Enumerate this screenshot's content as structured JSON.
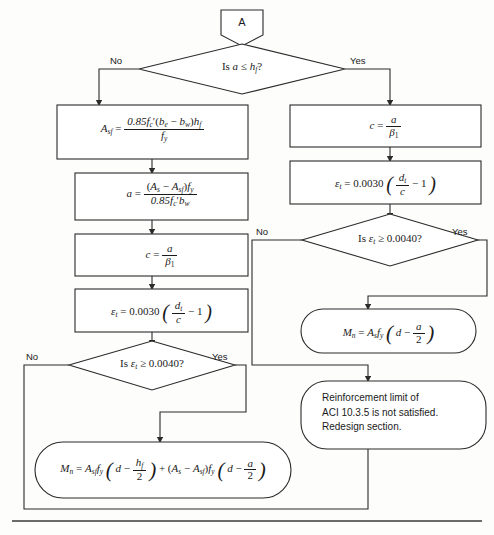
{
  "diagram": {
    "page_rule": "horizontal-rule-bottom",
    "colors": {
      "stroke": "#2b2b2b",
      "background": "#fdfdfc",
      "text": "#1a1a1a"
    }
  },
  "nodes": {
    "connector_a": {
      "label": "A",
      "shape": "pentagon-connector"
    },
    "decision_1": {
      "text": "Is a ≤ h_f ?",
      "shape": "diamond",
      "yes": "Yes",
      "no": "No"
    },
    "box_asf": {
      "text": "A_sf = 0.85 f'_c (b_e − b_w) h_f / f_y",
      "shape": "rect"
    },
    "box_a": {
      "text": "a = (A_s − A_sf) f_y / 0.85 f'_c b_w",
      "shape": "rect"
    },
    "box_c_left": {
      "text": "c = a / β₁",
      "shape": "rect"
    },
    "box_et_left": {
      "text": "ε_t = 0.0030 ( d_t / c − 1 )",
      "shape": "rect"
    },
    "decision_2": {
      "text": "Is ε_t ≥ 0.0040 ?",
      "shape": "diamond",
      "yes": "Yes",
      "no": "No"
    },
    "box_c_right": {
      "text": "c = a / β₁",
      "shape": "rect"
    },
    "box_et_right": {
      "text": "ε_t = 0.0030 ( d_t / c − 1 )",
      "shape": "rect"
    },
    "decision_3": {
      "text": "Is ε_t ≥ 0.0040 ?",
      "shape": "diamond",
      "yes": "Yes",
      "no": "No"
    },
    "oval_mn_right": {
      "text": "M_n = A_s f_y ( d − a/2 )",
      "shape": "rounded"
    },
    "oval_mn_left": {
      "text": "M_n = A_sf f_y ( d − h_f/2 ) + (A_s − A_sf) f_y ( d − a/2 )",
      "shape": "rounded"
    },
    "oval_redesign": {
      "shape": "rounded",
      "lines": [
        "Reinforcement limit of",
        "ACI 10.3.5 is not satisfied.",
        "Redesign section."
      ]
    }
  },
  "labels": {
    "d1_no": "No",
    "d1_yes": "Yes",
    "d2_no": "No",
    "d2_yes": "Yes",
    "d3_no": "No",
    "d3_yes": "Yes"
  },
  "math": {
    "asf_lhs": "A",
    "asf_sub": "sf",
    "eq": "=",
    "asf_num_a": "0.85",
    "asf_num_fc": "f",
    "asf_num_fc_sub": "c",
    "asf_num_mid": "(b",
    "asf_num_be": "e",
    "asf_num_minus": "− b",
    "asf_num_bw": "w",
    "asf_num_close": ")h",
    "asf_num_hf": "f",
    "asf_den_f": "f",
    "asf_den_sub": "y",
    "a_lhs": "a",
    "c_lhs": "c",
    "beta": "β",
    "beta_sub": "1",
    "eps": "ε",
    "eps_sub": "t",
    "const_0030": "0.0030",
    "dt": "d",
    "dt_sub": "t",
    "c_var": "c",
    "one": "1",
    "Mn": "M",
    "Mn_sub": "n",
    "As": "A",
    "As_sub": "s",
    "Asf_sub": "sf",
    "fy": "f",
    "fy_sub": "y",
    "d": "d",
    "two": "2",
    "hf": "h",
    "hf_sub": "f",
    "minus": "−",
    "plus": "+",
    "ge": "≥",
    "le": "≤",
    "is": "Is",
    "q": "?",
    "val_0040": "0.0040"
  }
}
